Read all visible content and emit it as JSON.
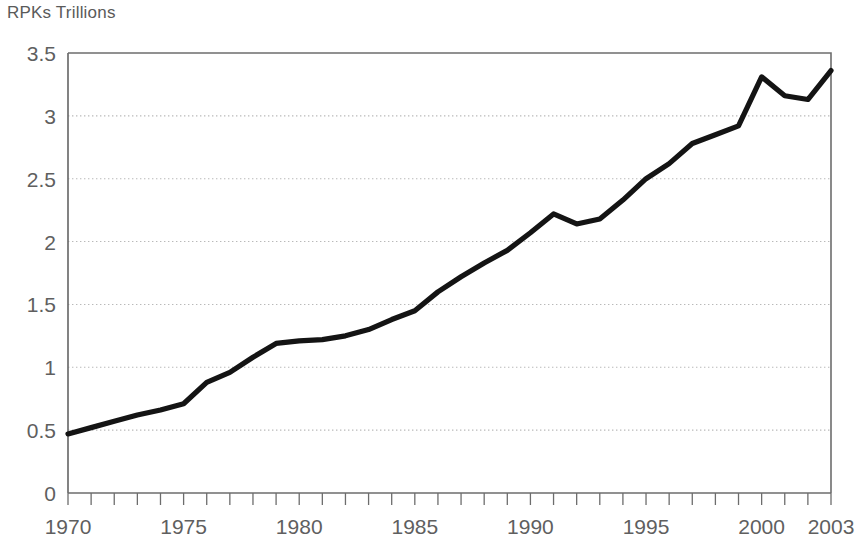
{
  "chart_data": {
    "type": "line",
    "title": "RPKs Trillions",
    "xlabel": "",
    "ylabel": "RPKs Trillions",
    "xlim": [
      1970,
      2003
    ],
    "ylim": [
      0,
      3.5
    ],
    "grid": true,
    "legend": null,
    "y_ticks": [
      "0",
      "0.5",
      "1",
      "1.5",
      "2",
      "2.5",
      "3",
      "3.5"
    ],
    "y_tick_values": [
      0,
      0.5,
      1,
      1.5,
      2,
      2.5,
      3,
      3.5
    ],
    "x_ticks": [
      "1970",
      "1975",
      "1980",
      "1985",
      "1990",
      "1995",
      "2000",
      "2003"
    ],
    "x_tick_values": [
      1970,
      1975,
      1980,
      1985,
      1990,
      1995,
      2000,
      2003
    ],
    "x_minor_tick_interval": 1,
    "series": [
      {
        "name": "RPKs",
        "color": "#141414",
        "x": [
          1970,
          1971,
          1972,
          1973,
          1974,
          1975,
          1976,
          1977,
          1978,
          1979,
          1980,
          1981,
          1982,
          1983,
          1984,
          1985,
          1986,
          1987,
          1988,
          1989,
          1990,
          1991,
          1992,
          1993,
          1994,
          1995,
          1996,
          1997,
          1998,
          1999,
          2000,
          2001,
          2002,
          2003
        ],
        "values": [
          0.47,
          0.52,
          0.57,
          0.62,
          0.66,
          0.71,
          0.88,
          0.96,
          1.08,
          1.19,
          1.21,
          1.22,
          1.25,
          1.3,
          1.38,
          1.45,
          1.6,
          1.72,
          1.83,
          1.93,
          2.07,
          2.22,
          2.14,
          2.18,
          2.33,
          2.5,
          2.62,
          2.78,
          2.85,
          2.92,
          3.31,
          3.16,
          3.13,
          3.36
        ]
      }
    ],
    "colors": {
      "line": "#141414",
      "axis": "#6d6d6d",
      "grid": "#b9b9b9",
      "text": "#5a5a5a",
      "background": "#ffffff"
    }
  },
  "geometry": {
    "plot_left": 68,
    "plot_right": 831,
    "plot_top": 53,
    "plot_bottom": 493
  }
}
